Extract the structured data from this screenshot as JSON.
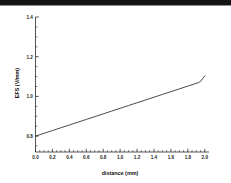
{
  "figure": {
    "background_color": "#ffffff",
    "top_bar_color": "#141414"
  },
  "chart_data": {
    "type": "line",
    "title": "",
    "subtitle": "",
    "xlabel": "distance (mm)",
    "ylabel": "EFS (V/mm)",
    "xlim": [
      0.0,
      2.05
    ],
    "ylim": [
      0.72,
      1.4
    ],
    "grid": false,
    "legend": null,
    "legend_position": "none",
    "x_major_ticks": [
      "0.0",
      "0.2",
      "0.4",
      "0.6",
      "0.8",
      "1.0",
      "1.2",
      "1.4",
      "1.6",
      "1.8",
      "2.0"
    ],
    "x_major_tick_values": [
      0.0,
      0.2,
      0.4,
      0.6,
      0.8,
      1.0,
      1.2,
      1.4,
      1.6,
      1.8,
      2.0
    ],
    "x_minor_tick_step": 0.05,
    "y_major_ticks": [
      "0.8",
      "1.0",
      "1.2",
      "1.4"
    ],
    "y_major_tick_values": [
      0.8,
      1.0,
      1.2,
      1.4
    ],
    "y_minor_tick_step": 0.05,
    "series": [
      {
        "name": "EFS",
        "color": "#2b2b2b",
        "x": [
          0.0,
          0.1,
          0.2,
          0.3,
          0.4,
          0.5,
          0.6,
          0.7,
          0.8,
          0.9,
          1.0,
          1.1,
          1.2,
          1.3,
          1.4,
          1.5,
          1.6,
          1.7,
          1.8,
          1.88,
          1.93,
          1.96,
          1.98,
          2.0
        ],
        "y": [
          0.8,
          0.814,
          0.828,
          0.842,
          0.856,
          0.87,
          0.884,
          0.898,
          0.912,
          0.926,
          0.94,
          0.954,
          0.968,
          0.982,
          0.996,
          1.01,
          1.024,
          1.038,
          1.052,
          1.063,
          1.07,
          1.08,
          1.093,
          1.103
        ]
      }
    ],
    "annotations": []
  }
}
